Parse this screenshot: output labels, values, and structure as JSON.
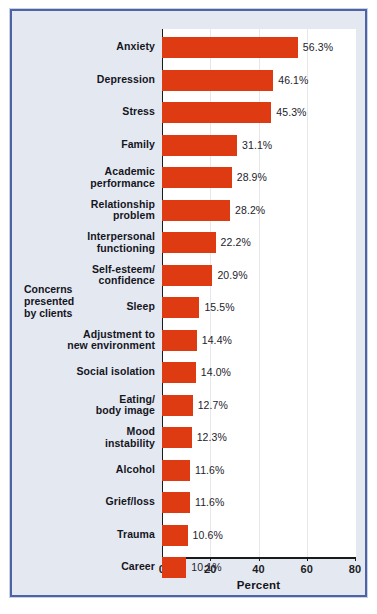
{
  "chart_data": {
    "type": "bar",
    "orientation": "horizontal",
    "title": "",
    "xlabel": "Percent",
    "ylabel": "Concerns presented by clients",
    "xlim": [
      0,
      80
    ],
    "xticks": [
      0,
      20,
      40,
      60,
      80
    ],
    "grid": "vertical-light",
    "legend": "none",
    "bar_color": "#de3b13",
    "background_color": "#e4e9f1",
    "plot_background_color": "#ffffff",
    "border_color": "#4e63a6",
    "categories": [
      "Anxiety",
      "Depression",
      "Stress",
      "Family",
      "Academic performance",
      "Relationship problem",
      "Interpersonal functioning",
      "Self-esteem/ confidence",
      "Sleep",
      "Adjustment to new environment",
      "Social isolation",
      "Eating/ body image",
      "Mood instability",
      "Alcohol",
      "Grief/loss",
      "Trauma",
      "Career"
    ],
    "values": [
      56.3,
      46.1,
      45.3,
      31.1,
      28.9,
      28.2,
      22.2,
      20.9,
      15.5,
      14.4,
      14.0,
      12.7,
      12.3,
      11.6,
      11.6,
      10.6,
      10.1
    ],
    "value_labels": [
      "56.3%",
      "46.1%",
      "45.3%",
      "31.1%",
      "28.9%",
      "28.2%",
      "22.2%",
      "20.9%",
      "15.5%",
      "14.4%",
      "14.0%",
      "12.7%",
      "12.3%",
      "11.6%",
      "11.6%",
      "10.6%",
      "10.1%"
    ]
  },
  "axis": {
    "x_title": "Percent",
    "y_group_label_lines": [
      "Concerns",
      "presented",
      "by clients"
    ],
    "tick_labels": [
      "0",
      "20",
      "40",
      "60",
      "80"
    ]
  },
  "rows": [
    {
      "label_lines": [
        "Anxiety"
      ],
      "value": 56.3,
      "value_label": "56.3%"
    },
    {
      "label_lines": [
        "Depression"
      ],
      "value": 46.1,
      "value_label": "46.1%"
    },
    {
      "label_lines": [
        "Stress"
      ],
      "value": 45.3,
      "value_label": "45.3%"
    },
    {
      "label_lines": [
        "Family"
      ],
      "value": 31.1,
      "value_label": "31.1%"
    },
    {
      "label_lines": [
        "Academic",
        "performance"
      ],
      "value": 28.9,
      "value_label": "28.9%"
    },
    {
      "label_lines": [
        "Relationship",
        "problem"
      ],
      "value": 28.2,
      "value_label": "28.2%"
    },
    {
      "label_lines": [
        "Interpersonal",
        "functioning"
      ],
      "value": 22.2,
      "value_label": "22.2%"
    },
    {
      "label_lines": [
        "Self-esteem/",
        "confidence"
      ],
      "value": 20.9,
      "value_label": "20.9%"
    },
    {
      "label_lines": [
        "Sleep"
      ],
      "value": 15.5,
      "value_label": "15.5%"
    },
    {
      "label_lines": [
        "Adjustment to",
        "new environment"
      ],
      "value": 14.4,
      "value_label": "14.4%"
    },
    {
      "label_lines": [
        "Social isolation"
      ],
      "value": 14.0,
      "value_label": "14.0%"
    },
    {
      "label_lines": [
        "Eating/",
        "body image"
      ],
      "value": 12.7,
      "value_label": "12.7%"
    },
    {
      "label_lines": [
        "Mood",
        "instability"
      ],
      "value": 12.3,
      "value_label": "12.3%"
    },
    {
      "label_lines": [
        "Alcohol"
      ],
      "value": 11.6,
      "value_label": "11.6%"
    },
    {
      "label_lines": [
        "Grief/loss"
      ],
      "value": 11.6,
      "value_label": "11.6%"
    },
    {
      "label_lines": [
        "Trauma"
      ],
      "value": 10.6,
      "value_label": "10.6%"
    },
    {
      "label_lines": [
        "Career"
      ],
      "value": 10.1,
      "value_label": "10.1%"
    }
  ]
}
